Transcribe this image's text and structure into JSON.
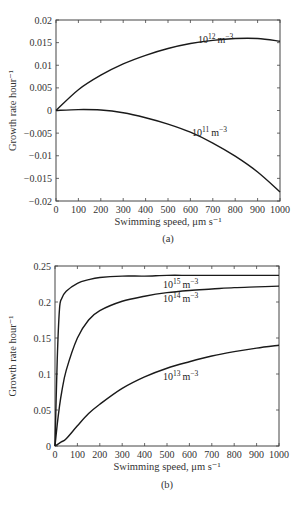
{
  "chart_data": [
    {
      "type": "line",
      "panel_label": "(a)",
      "xlabel": "Swimming speed, μm s⁻¹",
      "ylabel": "Growth rate hour⁻¹",
      "xlim": [
        0,
        1000
      ],
      "ylim": [
        -0.02,
        0.02
      ],
      "xticks": [
        "0",
        "100",
        "200",
        "300",
        "400",
        "500",
        "600",
        "700",
        "800",
        "900",
        "1000"
      ],
      "yticks": [
        "-0.02",
        "-0.015",
        "-0.01",
        "-0.005",
        "0",
        "0.005",
        "0.01",
        "0.015",
        "0.02"
      ],
      "x": [
        0,
        100,
        200,
        300,
        400,
        500,
        600,
        700,
        800,
        900,
        1000
      ],
      "series": [
        {
          "name": "10^12 m^-3",
          "label_base": "10",
          "label_exp": "12",
          "label_unit": "m",
          "label_unit_exp": "-3",
          "values": [
            0,
            0.0046,
            0.0078,
            0.0103,
            0.0122,
            0.0137,
            0.0148,
            0.0155,
            0.0159,
            0.0159,
            0.0153
          ]
        },
        {
          "name": "10^11 m^-3",
          "label_base": "10",
          "label_exp": "11",
          "label_unit": "m",
          "label_unit_exp": "-3",
          "values": [
            0,
            0.0002,
            0.0001,
            -0.0005,
            -0.0016,
            -0.003,
            -0.0048,
            -0.0072,
            -0.0101,
            -0.0136,
            -0.018
          ]
        }
      ],
      "grid": false
    },
    {
      "type": "line",
      "panel_label": "(b)",
      "xlabel": "Swimming speed, μm s⁻¹",
      "ylabel": "Growth rate hour⁻¹",
      "xlim": [
        0,
        1000
      ],
      "ylim": [
        0,
        0.25
      ],
      "xticks": [
        "0",
        "100",
        "200",
        "300",
        "400",
        "500",
        "600",
        "700",
        "800",
        "900",
        "1000"
      ],
      "yticks": [
        "0",
        "0.05",
        "0.1",
        "0.15",
        "0.2",
        "0.25"
      ],
      "x": [
        0,
        10,
        20,
        30,
        50,
        100,
        150,
        200,
        300,
        400,
        500,
        600,
        700,
        800,
        900,
        1000
      ],
      "series": [
        {
          "name": "10^15 m^-3",
          "label_base": "10",
          "label_exp": "15",
          "label_unit": "m",
          "label_unit_exp": "-3",
          "values": [
            0,
            0.12,
            0.19,
            0.205,
            0.215,
            0.226,
            0.231,
            0.234,
            0.236,
            0.236,
            0.237,
            0.237,
            0.237,
            0.237,
            0.237,
            0.237
          ]
        },
        {
          "name": "10^14 m^-3",
          "label_base": "10",
          "label_exp": "14",
          "label_unit": "m",
          "label_unit_exp": "-3",
          "values": [
            0,
            0.03,
            0.055,
            0.075,
            0.105,
            0.15,
            0.175,
            0.188,
            0.201,
            0.208,
            0.213,
            0.216,
            0.218,
            0.22,
            0.221,
            0.222
          ]
        },
        {
          "name": "10^13 m^-3",
          "label_base": "10",
          "label_exp": "13",
          "label_unit": "m",
          "label_unit_exp": "-3",
          "values": [
            0,
            0.002,
            0.004,
            0.006,
            0.01,
            0.028,
            0.045,
            0.058,
            0.08,
            0.096,
            0.108,
            0.117,
            0.125,
            0.131,
            0.136,
            0.14
          ]
        }
      ],
      "grid": false
    }
  ]
}
